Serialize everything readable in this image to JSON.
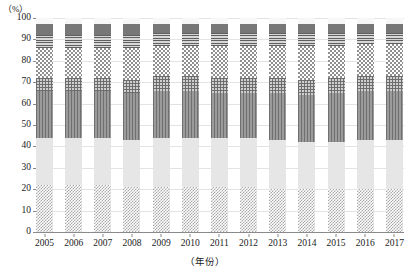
{
  "chart_data": {
    "type": "bar",
    "stacked": true,
    "normalized_percent": true,
    "title": "",
    "subtitle": "",
    "xlabel": "（年份）",
    "ylabel": "（%）",
    "ylim": [
      0,
      100
    ],
    "ytick_labels": [
      "100",
      "90",
      "80",
      "70",
      "60",
      "50",
      "40",
      "30",
      "20",
      "10",
      "0"
    ],
    "ytick_values": [
      100,
      90,
      80,
      70,
      60,
      50,
      40,
      30,
      20,
      10,
      0
    ],
    "grid": true,
    "grid_axis": "y",
    "legend": "none",
    "categories": [
      "2005",
      "2006",
      "2007",
      "2008",
      "2009",
      "2010",
      "2011",
      "2012",
      "2013",
      "2014",
      "2015",
      "2016",
      "2017"
    ],
    "series": [
      {
        "name": "segment-1",
        "pattern": "fine-checkerboard",
        "color": "#a8a8a8",
        "values": [
          22,
          22,
          22,
          21,
          21,
          21,
          21,
          21,
          20,
          20,
          20,
          20,
          20
        ]
      },
      {
        "name": "segment-2",
        "pattern": "solid-light-gray",
        "color": "#e6e6e6",
        "values": [
          22,
          22,
          22,
          22,
          23,
          23,
          23,
          23,
          23,
          22,
          22,
          23,
          23
        ]
      },
      {
        "name": "segment-3",
        "pattern": "vertical-stripes",
        "color": "#8d8d8d",
        "values": [
          22,
          22,
          22,
          22,
          22,
          22,
          21,
          21,
          22,
          22,
          23,
          23,
          23
        ]
      },
      {
        "name": "segment-4",
        "pattern": "crosshatch-grid",
        "color": "#6d6d6d",
        "values": [
          6,
          6,
          6,
          6,
          7,
          7,
          7,
          7,
          7,
          7,
          7,
          7,
          7
        ]
      },
      {
        "name": "segment-5",
        "pattern": "coarse-checkerboard",
        "color": "#8f8f8f",
        "values": [
          14,
          14,
          14,
          15,
          14,
          14,
          15,
          15,
          15,
          16,
          15,
          15,
          15
        ]
      },
      {
        "name": "segment-6",
        "pattern": "horizontal-lines",
        "color": "#5f5f5f",
        "values": [
          6,
          6,
          6,
          6,
          6,
          6,
          6,
          6,
          6,
          6,
          6,
          5,
          5
        ]
      },
      {
        "name": "segment-7",
        "pattern": "solid-dark-gray",
        "color": "#777777",
        "values": [
          5,
          5,
          5,
          5,
          4,
          4,
          4,
          4,
          4,
          4,
          4,
          4,
          4
        ]
      },
      {
        "name": "segment-8",
        "pattern": "light-cap",
        "color": "#f0f0f0",
        "values": [
          3,
          3,
          3,
          3,
          3,
          3,
          3,
          3,
          3,
          3,
          3,
          3,
          3
        ]
      }
    ]
  }
}
